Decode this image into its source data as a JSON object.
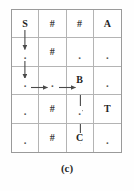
{
  "figure": {
    "caption": "(c)",
    "grid": {
      "rows": 5,
      "cols": 4,
      "cells": [
        [
          {
            "label": "S",
            "kind": "state"
          },
          {
            "label": "#",
            "kind": "wall"
          },
          {
            "label": "#",
            "kind": "wall"
          },
          {
            "label": "A",
            "kind": "state"
          }
        ],
        [
          {
            "label": ".",
            "kind": "empty"
          },
          {
            "label": "#",
            "kind": "wall"
          },
          {
            "label": ".",
            "kind": "empty"
          },
          {
            "label": ".",
            "kind": "empty"
          }
        ],
        [
          {
            "label": ".",
            "kind": "empty"
          },
          {
            "label": ".",
            "kind": "empty"
          },
          {
            "label": "B",
            "kind": "state"
          },
          {
            "label": ".",
            "kind": "empty"
          }
        ],
        [
          {
            "label": ".",
            "kind": "empty"
          },
          {
            "label": "#",
            "kind": "wall"
          },
          {
            "label": ".",
            "kind": "empty"
          },
          {
            "label": "T",
            "kind": "state"
          }
        ],
        [
          {
            "label": ".",
            "kind": "empty"
          },
          {
            "label": "#",
            "kind": "wall"
          },
          {
            "label": "C",
            "kind": "state"
          },
          {
            "label": ".",
            "kind": "empty"
          }
        ]
      ]
    },
    "arrows": [
      {
        "name": "arrow-s-down-row1-to-row2",
        "direction": "down",
        "from": {
          "row": 1,
          "col": 1
        },
        "to": {
          "row": 2,
          "col": 1
        }
      },
      {
        "name": "arrow-down-row2-to-row3",
        "direction": "down",
        "from": {
          "row": 2,
          "col": 1
        },
        "to": {
          "row": 3,
          "col": 1
        }
      },
      {
        "name": "arrow-right-col1-to-col2",
        "direction": "right",
        "from": {
          "row": 3,
          "col": 1
        },
        "to": {
          "row": 3,
          "col": 2
        }
      },
      {
        "name": "arrow-right-col2-to-b",
        "direction": "right",
        "from": {
          "row": 3,
          "col": 2
        },
        "to": {
          "row": 3,
          "col": 3
        }
      },
      {
        "name": "arrow-b-down-row3-to-row4",
        "direction": "down",
        "from": {
          "row": 3,
          "col": 3
        },
        "to": {
          "row": 4,
          "col": 3
        }
      },
      {
        "name": "arrow-down-row4-to-c",
        "direction": "down",
        "from": {
          "row": 4,
          "col": 3
        },
        "to": {
          "row": 5,
          "col": 3
        }
      }
    ],
    "colors": {
      "outer_border": "#9a9a9a",
      "inner_border": "#b4b4b4",
      "arrow": "#4a4a4a",
      "text": "#1f1f1f",
      "background": "#ffffff"
    }
  }
}
